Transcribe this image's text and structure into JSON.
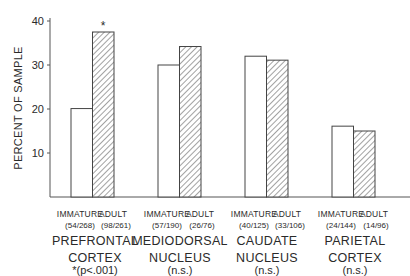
{
  "chart_data": {
    "type": "bar",
    "title": "",
    "xlabel": "",
    "ylabel": "PERCENT OF SAMPLE",
    "ylim": [
      0,
      40
    ],
    "yticks": [
      10,
      20,
      30,
      40
    ],
    "grid": false,
    "legend": null,
    "categories": [
      "PREFRONTAL CORTEX",
      "MEDIODORSAL NUCLEUS",
      "CAUDATE NUCLEUS",
      "PARIETAL CORTEX"
    ],
    "series": [
      {
        "name": "IMMATURE",
        "style": "open",
        "values": [
          20.1,
          30.0,
          32.0,
          16.1
        ],
        "counts": [
          "(54/268)",
          "(57/190)",
          "(40/125)",
          "(24/144)"
        ]
      },
      {
        "name": "ADULT",
        "style": "hatched",
        "values": [
          37.5,
          34.2,
          31.1,
          15.0
        ],
        "counts": [
          "(98/261)",
          "(26/76)",
          "(33/106)",
          "(14/96)"
        ]
      }
    ],
    "annotations": [
      {
        "text": "*",
        "target": "PREFRONTAL CORTEX ADULT bar"
      }
    ],
    "significance": [
      "*(p<.001)",
      "(n.s.)",
      "(n.s.)",
      "(n.s.)"
    ]
  },
  "axis": {
    "ylabel": "PERCENT OF SAMPLE",
    "ticks": [
      "10",
      "20",
      "30",
      "40"
    ]
  },
  "groups": [
    {
      "immature_label": "IMMATURE",
      "adult_label": "ADULT",
      "immature_count": "(54/268)",
      "adult_count": "(98/261)",
      "name_line1": "PREFRONTAL",
      "name_line2": "CORTEX",
      "sig": "*(p<.001)"
    },
    {
      "immature_label": "IMMATURE",
      "adult_label": "ADULT",
      "immature_count": "(57/190)",
      "adult_count": "(26/76)",
      "name_line1": "MEDIODORSAL",
      "name_line2": "NUCLEUS",
      "sig": "(n.s.)"
    },
    {
      "immature_label": "IMMATURE",
      "adult_label": "ADULT",
      "immature_count": "(40/125)",
      "adult_count": "(33/106)",
      "name_line1": "CAUDATE",
      "name_line2": "NUCLEUS",
      "sig": "(n.s.)"
    },
    {
      "immature_label": "IMMATURE",
      "adult_label": "ADULT",
      "immature_count": "(24/144)",
      "adult_count": "(14/96)",
      "name_line1": "PARIETAL",
      "name_line2": "CORTEX",
      "sig": "(n.s.)"
    }
  ],
  "star": "*"
}
